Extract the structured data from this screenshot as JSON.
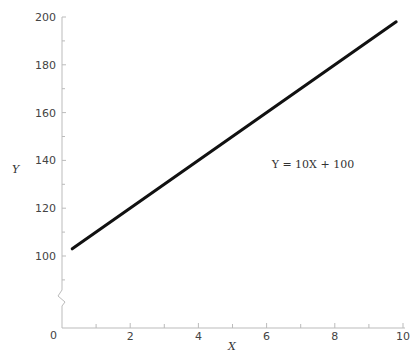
{
  "chart_data": {
    "type": "line",
    "title": "",
    "xlabel": "X",
    "ylabel": "Y",
    "xlim": [
      0,
      10
    ],
    "ylim": [
      100,
      200
    ],
    "y_axis_break": true,
    "origin_label": "0",
    "x_ticks": [
      2,
      4,
      6,
      8,
      10
    ],
    "x_tick_labels": [
      "2",
      "4",
      "6",
      "8",
      "10"
    ],
    "x_minor_ticks": [
      1,
      3,
      5,
      7,
      9
    ],
    "y_ticks": [
      100,
      120,
      140,
      160,
      180,
      200
    ],
    "y_tick_labels": [
      "100",
      "120",
      "140",
      "160",
      "180",
      "200"
    ],
    "y_minor_ticks": [
      90,
      110,
      130,
      150,
      170,
      190
    ],
    "grid": false,
    "series": [
      {
        "name": "Y = 10X + 100",
        "x": [
          0.3,
          9.8
        ],
        "y": [
          103,
          198
        ],
        "color": "#111111"
      }
    ],
    "annotations": [
      {
        "text": "Y = 10X + 100",
        "x": 6.5,
        "y": 137
      }
    ]
  }
}
